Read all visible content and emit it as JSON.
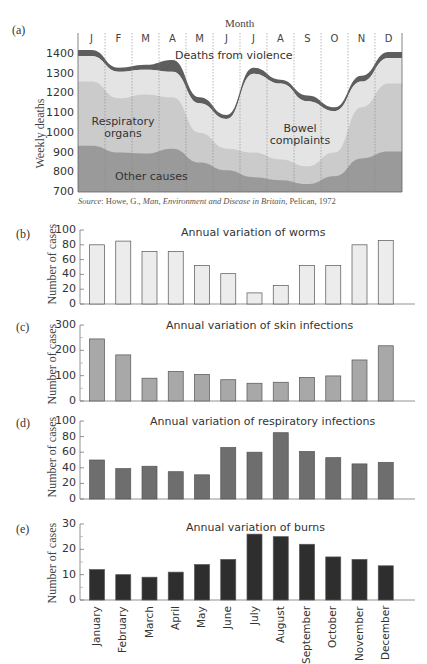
{
  "panel_a": {
    "letter": "(a)",
    "month_title": "Month",
    "months": [
      "J",
      "F",
      "M",
      "A",
      "M",
      "J",
      "J",
      "A",
      "S",
      "O",
      "N",
      "D"
    ],
    "ylabel": "Weekly deaths",
    "yticks": [
      "1400",
      "1300",
      "1200",
      "1100",
      "1000",
      "900",
      "800",
      "700"
    ],
    "labels": {
      "violence": "Deaths from violence",
      "respiratory_line1": "Respiratory",
      "respiratory_line2": "organs",
      "bowel_line1": "Bowel",
      "bowel_line2": "complaints",
      "other": "Other causes"
    },
    "source_prefix": "Source",
    "source_text": ": Howe, G., ",
    "source_italic": "Man, Environment and Disease in Britain",
    "source_suffix": ", Pelican, 1972"
  },
  "panel_b": {
    "letter": "(b)",
    "title": "Annual variation of worms",
    "ylabel": "Number of cases",
    "yticks": [
      "100",
      "80",
      "60",
      "40",
      "20",
      "0"
    ]
  },
  "panel_c": {
    "letter": "(c)",
    "title": "Annual variation of skin infections",
    "ylabel": "Number of cases",
    "yticks": [
      "300",
      "200",
      "100",
      "0"
    ]
  },
  "panel_d": {
    "letter": "(d)",
    "title": "Annual variation of respiratory infections",
    "ylabel": "Number of cases",
    "yticks": [
      "100",
      "80",
      "60",
      "40",
      "20",
      "0"
    ]
  },
  "panel_e": {
    "letter": "(e)",
    "title": "Annual variation of burns",
    "ylabel": "Number of cases",
    "yticks": [
      "30",
      "20",
      "10",
      "0"
    ]
  },
  "xcategories": [
    "January",
    "February",
    "March",
    "April",
    "May",
    "June",
    "July",
    "August",
    "September",
    "October",
    "November",
    "December"
  ],
  "colors": {
    "violence": "#5e5e5e",
    "bowel": "#e4e4e4",
    "respiratory": "#cbcbcb",
    "other": "#9a9a9a",
    "worms_bar": "#ececec",
    "skin_bar": "#a8a8a8",
    "resp_bar": "#6e6e6e",
    "burns_bar": "#2e2e2e"
  },
  "chart_data": [
    {
      "type": "area",
      "title": "Weekly deaths by cause (stacked)",
      "xlabel": "Month",
      "ylabel": "Weekly deaths",
      "ylim": [
        700,
        1450
      ],
      "categories": [
        "J",
        "F",
        "M",
        "A",
        "M",
        "J",
        "J",
        "A",
        "S",
        "O",
        "N",
        "D"
      ],
      "series": [
        {
          "name": "Other causes (top)",
          "values": [
            935,
            900,
            895,
            920,
            850,
            810,
            775,
            760,
            740,
            780,
            870,
            905
          ]
        },
        {
          "name": "Respiratory organs (top)",
          "values": [
            1260,
            1175,
            1195,
            1180,
            1000,
            920,
            900,
            865,
            830,
            900,
            1130,
            1250
          ]
        },
        {
          "name": "Bowel complaints (top)",
          "values": [
            1390,
            1310,
            1320,
            1310,
            1150,
            1070,
            1300,
            1250,
            1160,
            1110,
            1260,
            1380
          ]
        },
        {
          "name": "Deaths from violence (top)",
          "values": [
            1420,
            1330,
            1345,
            1370,
            1180,
            1090,
            1330,
            1270,
            1190,
            1130,
            1290,
            1410
          ]
        }
      ],
      "annotations": [
        "Deaths from violence",
        "Respiratory organs",
        "Bowel complaints",
        "Other causes"
      ],
      "source": "Source: Howe, G., Man, Environment and Disease in Britain, Pelican, 1972"
    },
    {
      "type": "bar",
      "title": "Annual variation of worms",
      "ylabel": "Number of cases",
      "ylim": [
        0,
        100
      ],
      "categories": [
        "January",
        "February",
        "March",
        "April",
        "May",
        "June",
        "July",
        "August",
        "September",
        "October",
        "November",
        "December"
      ],
      "values": [
        80,
        85,
        71,
        71,
        52,
        41,
        15,
        25,
        52,
        52,
        80,
        86
      ]
    },
    {
      "type": "bar",
      "title": "Annual variation of skin infections",
      "ylabel": "Number of cases",
      "ylim": [
        0,
        300
      ],
      "categories": [
        "January",
        "February",
        "March",
        "April",
        "May",
        "June",
        "July",
        "August",
        "September",
        "October",
        "November",
        "December"
      ],
      "values": [
        245,
        182,
        90,
        117,
        105,
        84,
        70,
        74,
        93,
        99,
        162,
        218
      ]
    },
    {
      "type": "bar",
      "title": "Annual variation of respiratory infections",
      "ylabel": "Number of cases",
      "ylim": [
        0,
        100
      ],
      "categories": [
        "January",
        "February",
        "March",
        "April",
        "May",
        "June",
        "July",
        "August",
        "September",
        "October",
        "November",
        "December"
      ],
      "values": [
        50,
        39,
        42,
        35,
        31,
        66,
        60,
        85,
        61,
        53,
        45,
        47
      ]
    },
    {
      "type": "bar",
      "title": "Annual variation of burns",
      "ylabel": "Number of cases",
      "ylim": [
        0,
        30
      ],
      "categories": [
        "January",
        "February",
        "March",
        "April",
        "May",
        "June",
        "July",
        "August",
        "September",
        "October",
        "November",
        "December"
      ],
      "values": [
        12,
        10,
        9,
        11,
        14,
        16,
        26,
        25,
        22,
        17,
        16,
        13.5
      ]
    }
  ]
}
